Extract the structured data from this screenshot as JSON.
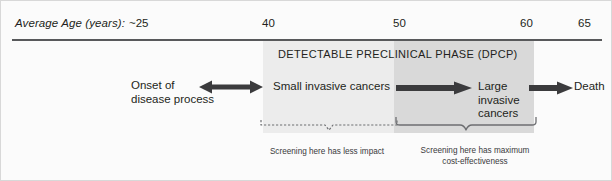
{
  "axis": {
    "label": "Average Age (years):",
    "ticks": [
      "~25",
      "40",
      "50",
      "60",
      "65"
    ]
  },
  "phase": {
    "title": "DETECTABLE PRECLINICAL PHASE (DPCP)"
  },
  "stages": {
    "onset": {
      "line1": "Onset of",
      "line2": "disease process"
    },
    "small": {
      "line1": "Small invasive cancers"
    },
    "large": {
      "line1": "Large",
      "line2": "invasive",
      "line3": "cancers"
    },
    "death": {
      "line1": "Death"
    }
  },
  "arrows": {
    "onset_to_small": "double-headed-arrow",
    "small_to_large": "right-arrow",
    "large_to_death": "right-arrow"
  },
  "captions": {
    "left": {
      "line1": "Screening here has less impact"
    },
    "right": {
      "line1": "Screening here has maximum",
      "line2": "cost-effectiveness"
    }
  },
  "colors": {
    "text": "#231f20",
    "rule": "#58595b",
    "band_light": "#ececec",
    "band_dark": "#d9d9d9",
    "caption_text": "#3a3a3c"
  }
}
